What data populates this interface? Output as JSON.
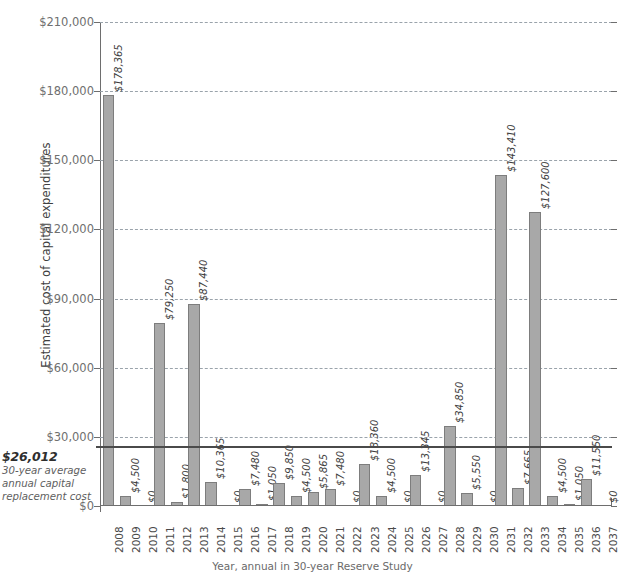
{
  "chart_data": {
    "type": "bar",
    "title": "",
    "xlabel": "Year",
    "ylabel": "Estimated cost of capital expenditures",
    "ylim": [
      0,
      210000
    ],
    "yticks": [
      0,
      30000,
      60000,
      90000,
      120000,
      150000,
      180000,
      210000
    ],
    "ytick_labels": [
      "$0",
      "$30,000",
      "$60,000",
      "$90,000",
      "$120,000",
      "$150,000",
      "$180,000",
      "$210,000"
    ],
    "grid": true,
    "legend": "none",
    "bar_color": "#a8a8a8",
    "bar_edge_color": "#7d7d7d",
    "categories": [
      "2008",
      "2009",
      "2010",
      "2011",
      "2012",
      "2013",
      "2014",
      "2015",
      "2016",
      "2017",
      "2018",
      "2019",
      "2020",
      "2021",
      "2022",
      "2023",
      "2024",
      "2025",
      "2026",
      "2027",
      "2028",
      "2029",
      "2030",
      "2031",
      "2032",
      "2033",
      "2034",
      "2035",
      "2036",
      "2037"
    ],
    "values": [
      178365,
      4500,
      0,
      79250,
      1800,
      87440,
      10365,
      0,
      7480,
      1050,
      9850,
      4500,
      5865,
      7480,
      0,
      18360,
      4500,
      0,
      13345,
      0,
      34850,
      5550,
      0,
      143410,
      7665,
      127600,
      4500,
      1050,
      11550,
      0
    ],
    "data_labels": [
      "$178,365",
      "$4,500",
      "$0",
      "$79,250",
      "$1,800",
      "$87,440",
      "$10,365",
      "$0",
      "$7,480",
      "$1,050",
      "$9,850",
      "$4,500",
      "$5,865",
      "$7,480",
      "$0",
      "$18,360",
      "$4,500",
      "$0",
      "$13,345",
      "$0",
      "$34,850",
      "$5,550",
      "$0",
      "$143,410",
      "$7,665",
      "$127,600",
      "$4,500",
      "$1,050",
      "$11,550",
      "$0"
    ],
    "annotations": [
      {
        "name": "average-line",
        "value": 26012,
        "label": "$26,012",
        "description": "30-year average\nannual capital\nreplacement cost",
        "color": "#4a4a4a"
      }
    ]
  },
  "axis": {
    "y_title": "Estimated cost of capital expenditures"
  },
  "average_note": {
    "value": "$26,012",
    "line1": "30-year average",
    "line2": "annual capital",
    "line3": "replacement cost"
  },
  "caption": {
    "text": "Year, annual in 30-year Reserve Study"
  }
}
